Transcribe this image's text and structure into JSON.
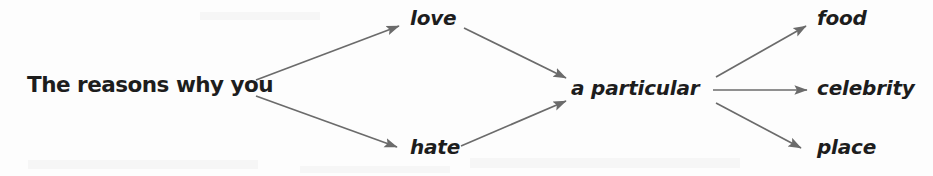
{
  "diagram": {
    "type": "flow-tree",
    "line_color": "#6b6b6b",
    "text_color": "#1d1d1d",
    "background_color": "#fdfdfd",
    "nodes": {
      "root": "The reasons why you",
      "branch_upper": "love",
      "branch_lower": "hate",
      "middle": "a particular",
      "leaf_upper": "food",
      "leaf_middle": "celebrity",
      "leaf_lower": "place"
    },
    "edges": [
      {
        "name": "root-to-love",
        "from": "The reasons why you",
        "to": "love",
        "x1": 256,
        "y1": 80,
        "x2": 399,
        "y2": 26
      },
      {
        "name": "root-to-hate",
        "from": "The reasons why you",
        "to": "hate",
        "x1": 256,
        "y1": 96,
        "x2": 397,
        "y2": 147
      },
      {
        "name": "love-to-particular",
        "from": "love",
        "to": "a particular",
        "x1": 464,
        "y1": 28,
        "x2": 566,
        "y2": 78
      },
      {
        "name": "hate-to-particular",
        "from": "hate",
        "to": "a particular",
        "x1": 461,
        "y1": 146,
        "x2": 566,
        "y2": 101
      },
      {
        "name": "particular-to-food",
        "from": "a particular",
        "to": "food",
        "x1": 716,
        "y1": 77,
        "x2": 806,
        "y2": 26
      },
      {
        "name": "particular-to-celebrity",
        "from": "a particular",
        "to": "celebrity",
        "x1": 713,
        "y1": 90,
        "x2": 807,
        "y2": 90
      },
      {
        "name": "particular-to-place",
        "from": "a particular",
        "to": "place",
        "x1": 716,
        "y1": 103,
        "x2": 801,
        "y2": 148
      }
    ]
  }
}
